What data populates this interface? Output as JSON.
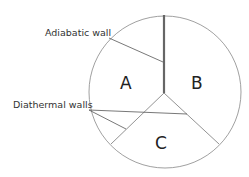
{
  "labels": {
    "adiabatic": "Adiabatic wall",
    "diathermal": "Diathermal walls"
  },
  "regions": {
    "a": "A",
    "b": "B",
    "c": "C"
  },
  "colors": {
    "line": "#555555",
    "thick_wall": "#666666",
    "background": "#ffffff"
  }
}
